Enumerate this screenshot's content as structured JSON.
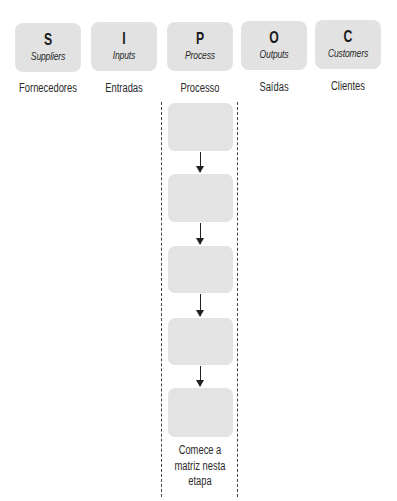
{
  "sipoc": {
    "columns": [
      {
        "letter": "S",
        "english": "Suppliers",
        "portuguese": "Fornecedores"
      },
      {
        "letter": "I",
        "english": "Inputs",
        "portuguese": "Entradas"
      },
      {
        "letter": "P",
        "english": "Process",
        "portuguese": "Processo"
      },
      {
        "letter": "O",
        "english": "Outputs",
        "portuguese": "Saídas"
      },
      {
        "letter": "C",
        "english": "Customers",
        "portuguese": "Clientes"
      }
    ],
    "process_steps": [
      {
        "label": ""
      },
      {
        "label": ""
      },
      {
        "label": ""
      },
      {
        "label": ""
      },
      {
        "label": ""
      }
    ],
    "start_note": {
      "line1": "Comece a",
      "line2": "matriz nesta",
      "line3": "etapa"
    }
  },
  "colors": {
    "box_fill": "#e3e3e3",
    "text": "#1e1e1e",
    "arrow": "#222222",
    "dashed_border": "#444444"
  }
}
